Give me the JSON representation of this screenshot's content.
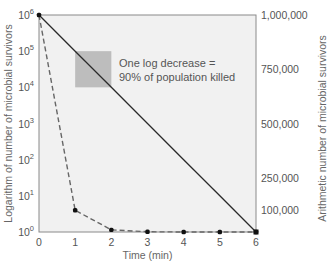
{
  "chart_data": {
    "type": "line",
    "title": "",
    "xlabel": "Time (min)",
    "ylabel": "Logarithm of number of microbial survivors",
    "y2label": "Arithmetic number of microbial survivors",
    "x_ticks": [
      "0",
      "1",
      "2",
      "3",
      "4",
      "5",
      "6"
    ],
    "xlim": [
      0,
      6
    ],
    "ylim_log": [
      1,
      1000000
    ],
    "y_ticks_log": [
      {
        "exp": 0,
        "base": "10",
        "sup": "0"
      },
      {
        "exp": 1,
        "base": "10",
        "sup": "1"
      },
      {
        "exp": 2,
        "base": "10",
        "sup": "2"
      },
      {
        "exp": 3,
        "base": "10",
        "sup": "3"
      },
      {
        "exp": 4,
        "base": "10",
        "sup": "4"
      },
      {
        "exp": 5,
        "base": "10",
        "sup": "5"
      },
      {
        "exp": 6,
        "base": "10",
        "sup": "6"
      }
    ],
    "y2_ticks": [
      {
        "value": 1000000,
        "label": "1,000,000"
      },
      {
        "value": 750000,
        "label": "750,000"
      },
      {
        "value": 500000,
        "label": "500,000"
      },
      {
        "value": 250000,
        "label": "250,000"
      },
      {
        "value": 100000,
        "label": "100,000"
      }
    ],
    "ylim_arith": [
      0,
      1000000
    ],
    "series": [
      {
        "name": "Logarithmic plot (straight line)",
        "style": "solid",
        "axis": "log",
        "x": [
          0,
          1,
          2,
          3,
          4,
          5,
          6
        ],
        "values": [
          1000000,
          100000,
          10000,
          1000,
          100,
          10,
          1
        ]
      },
      {
        "name": "Arithmetic plot (curve)",
        "style": "dashed",
        "axis": "arithmetic",
        "x": [
          0,
          1,
          2,
          3,
          4,
          5,
          6
        ],
        "values": [
          1000000,
          100000,
          10000,
          1000,
          100,
          10,
          1
        ]
      }
    ],
    "annotation": {
      "line1": "One log decrease =",
      "line2": "90% of population killed",
      "box_from_exp": 5,
      "box_to_exp": 4,
      "box_from_x": 1,
      "box_to_x": 2
    },
    "grid": false,
    "colors": {
      "plot_bg": "#f1f1f1",
      "frame": "#8a8a8a",
      "line": "#2a2a2a",
      "dashed": "#666666",
      "box": "#bdbdbd",
      "marker": "#111111"
    }
  }
}
